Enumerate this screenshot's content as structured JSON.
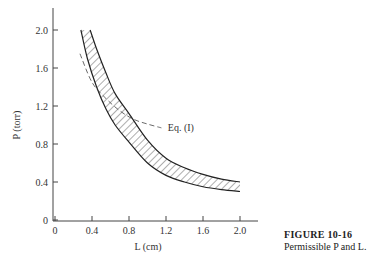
{
  "chart_data": {
    "type": "area",
    "title": "",
    "xlabel": "L (cm)",
    "ylabel": "P (torr)",
    "xlim": [
      0,
      2.1
    ],
    "ylim": [
      0,
      2.2
    ],
    "x_ticks": [
      "0",
      "0.4",
      "0.8",
      "1.2",
      "1.6",
      "2.0"
    ],
    "y_ticks": [
      "0",
      "0.4",
      "0.8",
      "1.2",
      "1.6",
      "2.0"
    ],
    "grid": false,
    "series": [
      {
        "name": "Upper bound",
        "style": "solid",
        "x": [
          0.38,
          0.45,
          0.55,
          0.65,
          0.8,
          1.0,
          1.2,
          1.4,
          1.6,
          1.8,
          2.0
        ],
        "y": [
          2.0,
          1.8,
          1.55,
          1.33,
          1.12,
          0.84,
          0.65,
          0.55,
          0.48,
          0.43,
          0.4
        ]
      },
      {
        "name": "Lower bound",
        "style": "solid",
        "x": [
          0.28,
          0.35,
          0.45,
          0.55,
          0.65,
          0.8,
          1.0,
          1.2,
          1.4,
          1.6,
          1.8,
          2.0
        ],
        "y": [
          2.0,
          1.7,
          1.4,
          1.17,
          1.0,
          0.82,
          0.6,
          0.47,
          0.4,
          0.35,
          0.32,
          0.3
        ]
      },
      {
        "name": "Eq. (I)",
        "style": "dashed",
        "x": [
          0.27,
          0.4,
          0.55,
          0.7,
          0.85,
          1.0,
          1.15
        ],
        "y": [
          1.75,
          1.45,
          1.28,
          1.15,
          1.06,
          1.01,
          0.97
        ]
      }
    ],
    "shaded_region": "hatched band between Upper bound and Lower bound",
    "annotations": [
      {
        "text": "Eq. (I)",
        "x": 1.22,
        "y": 0.97
      }
    ]
  },
  "caption": {
    "figure_label": "FIGURE 10-16",
    "text": "Permissible P and L."
  }
}
